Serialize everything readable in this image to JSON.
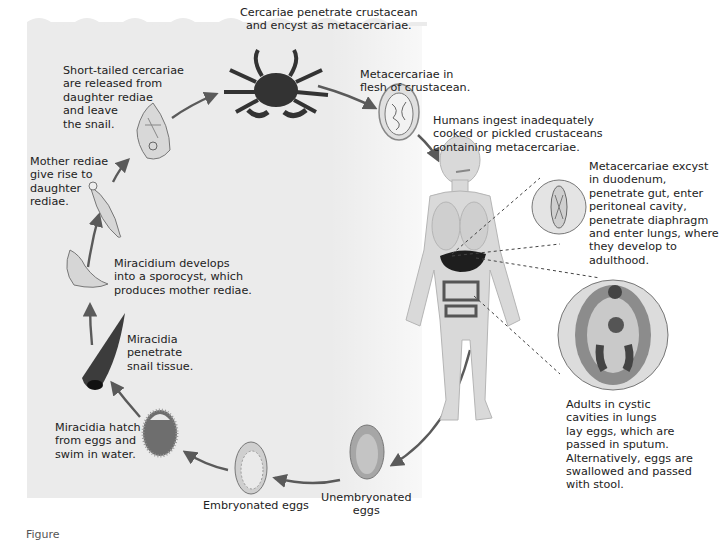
{
  "diagram": {
    "type": "life-cycle",
    "stages": [
      {
        "id": "cercariae-crustacean",
        "text": "Cercariae penetrate crustacean\nand encyst as metacercariae."
      },
      {
        "id": "metacercariae-flesh",
        "text": "Metacercariae in\nflesh of crustacean."
      },
      {
        "id": "human-ingest",
        "text": "Humans ingest inadequately\ncooked or pickled crustaceans\ncontaining metacercariae."
      },
      {
        "id": "excyst",
        "text": "Metacercariae excyst\nin duodenum,\npenetrate gut, enter\nperitoneal cavity,\npenetrate diaphragm\nand enter lungs, where\nthey develop to\nadulthood."
      },
      {
        "id": "adults-lungs",
        "text": "Adults in cystic\ncavities in lungs\nlay eggs, which are\npassed in sputum.\nAlternatively, eggs are\nswallowed and passed\nwith stool."
      },
      {
        "id": "unembryonated-eggs",
        "text": "Unembryonated\neggs"
      },
      {
        "id": "embryonated-eggs",
        "text": "Embryonated eggs"
      },
      {
        "id": "miracidia-hatch",
        "text": "Miracidia hatch\nfrom eggs and\nswim in water."
      },
      {
        "id": "miracidia-penetrate",
        "text": "Miracidia\npenetrate\nsnail tissue."
      },
      {
        "id": "sporocyst",
        "text": "Miracidium develops\ninto a sporocyst, which\nproduces mother rediae."
      },
      {
        "id": "mother-rediae",
        "text": "Mother rediae\ngive rise to\ndaughter\nrediae."
      },
      {
        "id": "cercariae-released",
        "text": "Short-tailed cercariae\nare released from\ndaughter rediae\nand leave\nthe snail."
      }
    ],
    "illustrations": [
      "crab",
      "metacercaria-cyst",
      "human-body",
      "excysted-fluke",
      "adult-fluke",
      "unembryonated-egg",
      "embryonated-egg",
      "miracidium",
      "snail",
      "sporocyst",
      "redia",
      "cercaria-in-redia"
    ],
    "colors": {
      "water": "#ebebeb",
      "arrow": "#5a5a5a",
      "body": "#d9d9d9",
      "organ_dark": "#2a2a2a",
      "text": "#222222"
    }
  },
  "caption": {
    "text": "Figure"
  }
}
